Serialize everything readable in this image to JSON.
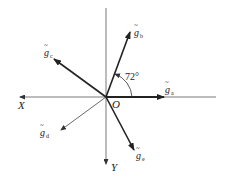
{
  "diagram": {
    "type": "vector-diagram",
    "origin": {
      "label": "O",
      "x": 106,
      "y": 97
    },
    "axes": [
      {
        "name": "x-axis",
        "label": "X",
        "direction": "left"
      },
      {
        "name": "y-axis",
        "label": "Y",
        "direction": "down"
      }
    ],
    "vectors": [
      {
        "id": "a",
        "symbol": "g",
        "subscript": "a",
        "angle_deg": 0,
        "style": "bold"
      },
      {
        "id": "b",
        "symbol": "g",
        "subscript": "b",
        "angle_deg": 72,
        "style": "bold"
      },
      {
        "id": "c",
        "symbol": "g",
        "subscript": "c",
        "angle_deg": 144,
        "style": "bold"
      },
      {
        "id": "d",
        "symbol": "g",
        "subscript": "d",
        "angle_deg": 216,
        "style": "thin"
      },
      {
        "id": "e",
        "symbol": "g",
        "subscript": "e",
        "angle_deg": 288,
        "style": "bold"
      }
    ],
    "angle_annotation": {
      "label": "72°",
      "between": [
        "a",
        "b"
      ]
    },
    "colors": {
      "line": "#222222",
      "axis": "#555555",
      "background": "#ffffff"
    }
  }
}
